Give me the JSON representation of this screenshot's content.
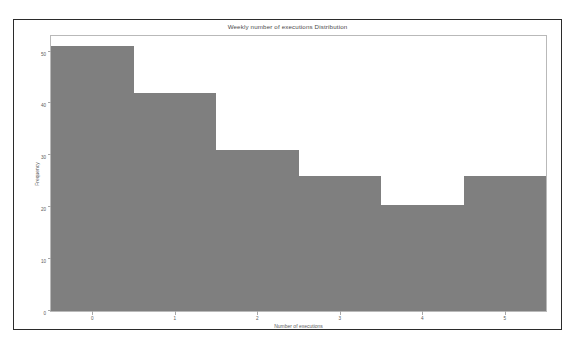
{
  "chart_data": {
    "type": "bar",
    "title": "Weekly number of executions Distribution",
    "xlabel": "Number of executions",
    "ylabel": "Frequency",
    "categories": [
      "0",
      "1",
      "2",
      "3",
      "4",
      "5"
    ],
    "values": [
      51,
      42,
      31,
      26,
      20.5,
      26
    ],
    "xlim": [
      -0.5,
      5.5
    ],
    "ylim": [
      0,
      53
    ],
    "yticks": [
      0,
      10,
      20,
      30,
      40,
      50
    ],
    "ytick_labels": [
      "0",
      "10",
      "20",
      "30",
      "40",
      "50"
    ],
    "xticks": [
      0,
      1,
      2,
      3,
      4,
      5
    ],
    "xtick_labels": [
      "0",
      "1",
      "2",
      "3",
      "4",
      "5"
    ],
    "grid": false,
    "legend": null,
    "bar_color": "#7f7f7f",
    "frame_color": "#b9b9b9",
    "border_color": "#2b2b2b",
    "background": "#ffffff"
  }
}
